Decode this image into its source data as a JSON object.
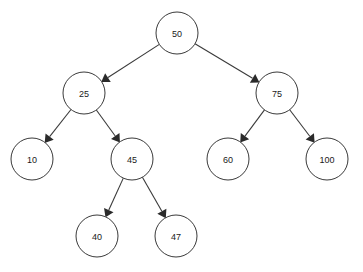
{
  "diagram": {
    "type": "binary-search-tree",
    "title": "",
    "background_color": "#ffffff",
    "node_fill": "#ffffff",
    "node_stroke": "#3a3a3a",
    "edge_color": "#3a3a3a",
    "label_color": "#1a1a1a",
    "node_radius": 21,
    "nodes": [
      {
        "id": "n50",
        "label": "50",
        "cx": 177,
        "cy": 33,
        "level": 0
      },
      {
        "id": "n25",
        "label": "25",
        "cx": 84,
        "cy": 93,
        "level": 1
      },
      {
        "id": "n75",
        "label": "75",
        "cx": 277,
        "cy": 93,
        "level": 1
      },
      {
        "id": "n10",
        "label": "10",
        "cx": 32,
        "cy": 159,
        "level": 2
      },
      {
        "id": "n45",
        "label": "45",
        "cx": 132,
        "cy": 159,
        "level": 2
      },
      {
        "id": "n60",
        "label": "60",
        "cx": 228,
        "cy": 159,
        "level": 2
      },
      {
        "id": "n100",
        "label": "100",
        "cx": 327,
        "cy": 159,
        "level": 2
      },
      {
        "id": "n40",
        "label": "40",
        "cx": 97,
        "cy": 236,
        "level": 3
      },
      {
        "id": "n47",
        "label": "47",
        "cx": 176,
        "cy": 236,
        "level": 3
      }
    ],
    "edges": [
      {
        "id": "e50-25",
        "from": "n50",
        "to": "n25",
        "from_label": "50",
        "to_label": "25",
        "side": "left"
      },
      {
        "id": "e50-75",
        "from": "n50",
        "to": "n75",
        "from_label": "50",
        "to_label": "75",
        "side": "right"
      },
      {
        "id": "e25-10",
        "from": "n25",
        "to": "n10",
        "from_label": "25",
        "to_label": "10",
        "side": "left"
      },
      {
        "id": "e25-45",
        "from": "n25",
        "to": "n45",
        "from_label": "25",
        "to_label": "45",
        "side": "right"
      },
      {
        "id": "e75-60",
        "from": "n75",
        "to": "n60",
        "from_label": "75",
        "to_label": "60",
        "side": "left"
      },
      {
        "id": "e75-100",
        "from": "n75",
        "to": "n100",
        "from_label": "75",
        "to_label": "100",
        "side": "right"
      },
      {
        "id": "e45-40",
        "from": "n45",
        "to": "n40",
        "from_label": "45",
        "to_label": "40",
        "side": "left"
      },
      {
        "id": "e45-47",
        "from": "n45",
        "to": "n47",
        "from_label": "45",
        "to_label": "47",
        "side": "right"
      }
    ]
  }
}
